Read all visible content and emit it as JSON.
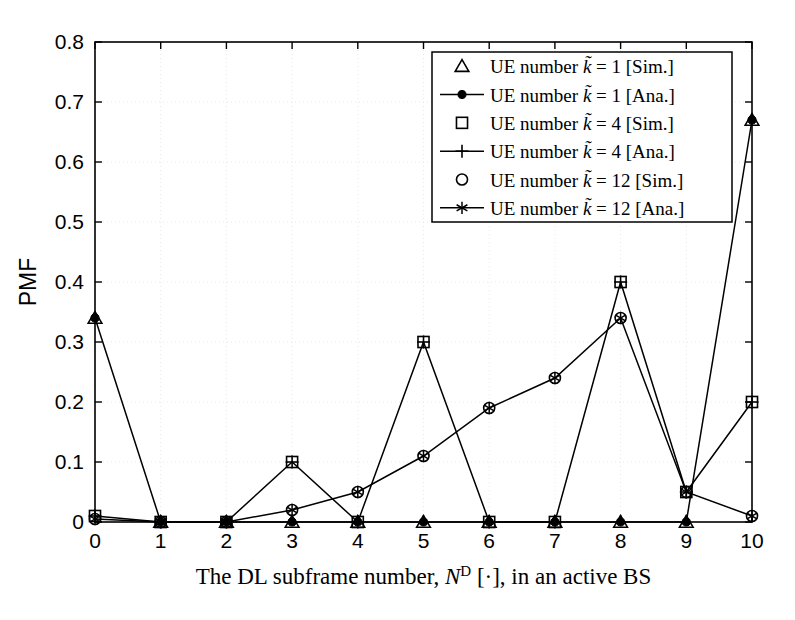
{
  "figure": {
    "background_color": "#ffffff",
    "axis_color": "#000000",
    "grid_color": "#e8e8e8",
    "series_color": "#000000"
  },
  "axes": {
    "ylabel": "PMF",
    "xlabel_prefix": "The DL subframe number, ",
    "xlabel_var": "N",
    "xlabel_sup": "D",
    "xlabel_suffix": " [·], in an active BS",
    "x_ticks": [
      "0",
      "1",
      "2",
      "3",
      "4",
      "5",
      "6",
      "7",
      "8",
      "9",
      "10"
    ],
    "y_ticks": [
      "0",
      "0.1",
      "0.2",
      "0.3",
      "0.4",
      "0.5",
      "0.6",
      "0.7",
      "0.8"
    ]
  },
  "legend": {
    "items": [
      {
        "marker": "triangle-open",
        "line": false,
        "label_pre": "UE number ",
        "label_var": "k̃",
        "label_post": " = 1 [Sim.]"
      },
      {
        "marker": "circle-filled",
        "line": true,
        "label_pre": "UE number ",
        "label_var": "k̃",
        "label_post": " = 1 [Ana.]"
      },
      {
        "marker": "square-open",
        "line": false,
        "label_pre": "UE number ",
        "label_var": "k̃",
        "label_post": " = 4 [Sim.]"
      },
      {
        "marker": "plus",
        "line": true,
        "label_pre": "UE number ",
        "label_var": "k̃",
        "label_post": " = 4 [Ana.]"
      },
      {
        "marker": "circle-open",
        "line": false,
        "label_pre": "UE number ",
        "label_var": "k̃",
        "label_post": " = 12 [Sim.]"
      },
      {
        "marker": "asterisk",
        "line": true,
        "label_pre": "UE number ",
        "label_var": "k̃",
        "label_post": " = 12 [Ana.]"
      }
    ]
  },
  "chart_data": {
    "type": "line",
    "title": "",
    "xlabel": "The DL subframe number, N^D [·], in an active BS",
    "ylabel": "PMF",
    "xlim": [
      0,
      10
    ],
    "ylim": [
      0,
      0.8
    ],
    "grid": true,
    "legend_position": "top-right",
    "x": [
      0,
      1,
      2,
      3,
      4,
      5,
      6,
      7,
      8,
      9,
      10
    ],
    "series": [
      {
        "name": "UE number k = 1 [Sim.]",
        "marker": "triangle-open",
        "line": false,
        "values": [
          0.34,
          0.0,
          0.0,
          0.0,
          0.0,
          0.0,
          0.0,
          0.0,
          0.0,
          0.0,
          0.67
        ]
      },
      {
        "name": "UE number k = 1 [Ana.]",
        "marker": "circle-filled",
        "line": true,
        "values": [
          0.34,
          0.0,
          0.0,
          0.0,
          0.0,
          0.0,
          0.0,
          0.0,
          0.0,
          0.0,
          0.67
        ]
      },
      {
        "name": "UE number k = 4 [Sim.]",
        "marker": "square-open",
        "line": false,
        "values": [
          0.01,
          0.0,
          0.0,
          0.1,
          0.0,
          0.3,
          0.0,
          0.0,
          0.4,
          0.05,
          0.2
        ]
      },
      {
        "name": "UE number k = 4 [Ana.]",
        "marker": "plus",
        "line": true,
        "values": [
          0.01,
          0.0,
          0.0,
          0.1,
          0.0,
          0.3,
          0.0,
          0.0,
          0.4,
          0.05,
          0.2
        ]
      },
      {
        "name": "UE number k = 12 [Sim.]",
        "marker": "circle-open",
        "line": false,
        "values": [
          0.005,
          0.0,
          0.0,
          0.02,
          0.05,
          0.11,
          0.19,
          0.24,
          0.34,
          0.05,
          0.01
        ]
      },
      {
        "name": "UE number k = 12 [Ana.]",
        "marker": "asterisk",
        "line": true,
        "values": [
          0.005,
          0.0,
          0.0,
          0.02,
          0.05,
          0.11,
          0.19,
          0.24,
          0.34,
          0.05,
          0.01
        ]
      }
    ]
  }
}
